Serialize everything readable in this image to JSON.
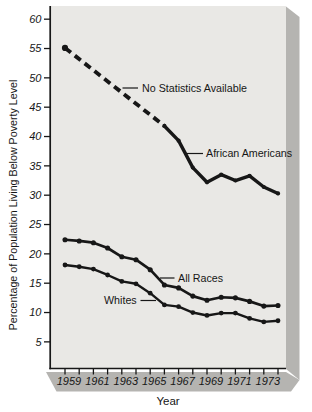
{
  "chart_data": {
    "type": "line",
    "title": "",
    "xlabel": "Year",
    "ylabel": "Percentage of Population Living Below Poverty Level",
    "x": [
      1959,
      1960,
      1961,
      1962,
      1963,
      1964,
      1965,
      1966,
      1967,
      1968,
      1969,
      1970,
      1971,
      1972,
      1973,
      1974
    ],
    "x_tick_labels": [
      "1959",
      "1961",
      "1963",
      "1965",
      "1967",
      "1969",
      "1971",
      "1973"
    ],
    "yticks": [
      5,
      10,
      15,
      20,
      25,
      30,
      35,
      40,
      45,
      50,
      55,
      60
    ],
    "ylim": [
      0,
      62
    ],
    "grid": false,
    "legend_position": "inline-annotations",
    "series": [
      {
        "name": "African Americans",
        "style": "dashed from 1959 to 1966 (no data 1960-1965), solid 1966-1974",
        "values": [
          55.1,
          null,
          null,
          null,
          null,
          null,
          null,
          41.8,
          39.3,
          34.7,
          32.2,
          33.5,
          32.5,
          33.3,
          31.4,
          30.3
        ]
      },
      {
        "name": "All Races",
        "style": "solid with point markers",
        "values": [
          22.4,
          22.2,
          21.9,
          21.0,
          19.5,
          19.0,
          17.3,
          14.7,
          14.2,
          12.8,
          12.1,
          12.6,
          12.5,
          11.9,
          11.1,
          11.2
        ]
      },
      {
        "name": "Whites",
        "style": "solid with point markers",
        "values": [
          18.1,
          17.8,
          17.4,
          16.4,
          15.3,
          14.9,
          13.3,
          11.3,
          11.0,
          10.0,
          9.5,
          9.9,
          9.9,
          9.0,
          8.4,
          8.6
        ]
      }
    ],
    "annotations": {
      "no_statistics": "No Statistics Available",
      "african_americans": "African Americans",
      "all_races": "All Races",
      "whites": "Whites"
    }
  },
  "colors": {
    "panel": "#e9e8e5",
    "shadow": "#b5b4b1",
    "shadow_light": "#c6c5c2",
    "line": "#171717",
    "text": "#161616"
  }
}
